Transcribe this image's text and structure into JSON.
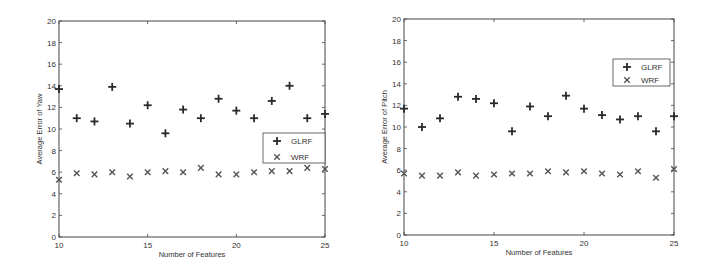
{
  "chart_data": [
    {
      "type": "scatter",
      "title": "",
      "xlabel": "Number of Features",
      "ylabel": "Average Error of Yaw",
      "xlim": [
        10,
        25
      ],
      "ylim": [
        0,
        20
      ],
      "xticks": [
        10,
        15,
        20,
        25
      ],
      "yticks": [
        0,
        2,
        4,
        6,
        8,
        10,
        12,
        14,
        16,
        18,
        20
      ],
      "grid": false,
      "legend_position": "right-middle",
      "x": [
        10,
        11,
        12,
        13,
        14,
        15,
        16,
        17,
        18,
        19,
        20,
        21,
        22,
        23,
        24,
        25
      ],
      "series": [
        {
          "name": "GLRF",
          "marker": "plus",
          "values": [
            13.7,
            11.0,
            10.7,
            13.9,
            10.5,
            12.2,
            9.6,
            11.8,
            11.0,
            12.8,
            11.7,
            11.0,
            12.6,
            14.0,
            11.0,
            11.4
          ]
        },
        {
          "name": "WRF",
          "marker": "x",
          "values": [
            5.3,
            5.9,
            5.8,
            6.0,
            5.6,
            6.0,
            6.1,
            6.0,
            6.4,
            5.8,
            5.8,
            6.0,
            6.1,
            6.1,
            6.4,
            6.3
          ]
        }
      ]
    },
    {
      "type": "scatter",
      "title": "",
      "xlabel": "Number of Features",
      "ylabel": "Average Error of Pitch",
      "xlim": [
        10,
        25
      ],
      "ylim": [
        0,
        20
      ],
      "xticks": [
        10,
        15,
        20,
        25
      ],
      "yticks": [
        0,
        2,
        4,
        6,
        8,
        10,
        12,
        14,
        16,
        18,
        20
      ],
      "grid": false,
      "legend_position": "upper-right",
      "x": [
        10,
        11,
        12,
        13,
        14,
        15,
        16,
        17,
        18,
        19,
        20,
        21,
        22,
        23,
        24,
        25
      ],
      "series": [
        {
          "name": "GLRF",
          "marker": "plus",
          "values": [
            11.7,
            10.0,
            10.8,
            12.8,
            12.6,
            12.2,
            9.6,
            11.9,
            11.0,
            12.9,
            11.7,
            11.1,
            10.7,
            11.0,
            9.6,
            11.0
          ]
        },
        {
          "name": "WRF",
          "marker": "x",
          "values": [
            5.7,
            5.5,
            5.5,
            5.8,
            5.5,
            5.6,
            5.7,
            5.7,
            5.9,
            5.8,
            5.9,
            5.7,
            5.6,
            5.9,
            5.3,
            6.1
          ]
        }
      ]
    }
  ],
  "panels": [
    {
      "id": "yaw",
      "xlabel": "Number of Features",
      "ylabel": "Average Error of Yaw",
      "legend": [
        "GLRF",
        "WRF"
      ]
    },
    {
      "id": "pitch",
      "xlabel": "Number of Features",
      "ylabel": "Average Error of Pitch",
      "legend": [
        "GLRF",
        "WRF"
      ]
    }
  ],
  "colors": {
    "marker": "#2a2a2a",
    "wrf_marker": "#555555",
    "axis": "#444444",
    "text": "#333333"
  }
}
